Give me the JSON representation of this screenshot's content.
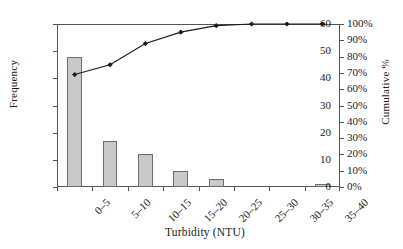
{
  "chart_data": {
    "type": "bar",
    "title": "",
    "subtitle": "",
    "xlabel": "Turbidity (NTU)",
    "ylabel": "Frequency",
    "y2label": "Cumulative %",
    "categories": [
      "0–5",
      "5–10",
      "10–15",
      "15–20",
      "20–25",
      "25–30",
      "30–35",
      "35–40"
    ],
    "series": [
      {
        "name": "Frequency",
        "type": "bar",
        "axis": "left",
        "values": [
          48,
          17,
          12,
          6,
          3,
          0,
          0,
          1
        ],
        "bar_fill": "#c9c9c9",
        "bar_edge": "#6d6d6d"
      },
      {
        "name": "Cumulative %",
        "type": "line",
        "axis": "right",
        "values": [
          69,
          75,
          88,
          95,
          99,
          100,
          100,
          100
        ],
        "line_color": "#1a1a1a",
        "marker": "diamond"
      }
    ],
    "ylim": [
      0,
      60
    ],
    "yticks": [
      0,
      10,
      20,
      30,
      40,
      50,
      60
    ],
    "ytick_labels": [
      "0",
      "10",
      "20",
      "30",
      "40",
      "50",
      "60"
    ],
    "y2lim": [
      0,
      100
    ],
    "y2ticks": [
      0,
      10,
      20,
      30,
      40,
      50,
      60,
      70,
      80,
      90,
      100
    ],
    "y2tick_labels": [
      "0%",
      "10%",
      "20%",
      "30%",
      "40%",
      "50%",
      "60%",
      "70%",
      "80%",
      "90%",
      "100%"
    ],
    "grid": false,
    "legend": "none"
  }
}
